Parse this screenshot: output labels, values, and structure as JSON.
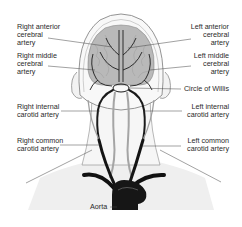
{
  "diagram": {
    "colors": {
      "background": "#ffffff",
      "brain_fill": "#b8b8b8",
      "artery_dark": "#1a1a1a",
      "artery_light": "#9a9a9a",
      "outline": "#7a7a7a",
      "shading": "#ededed",
      "label_text": "#2a2a2a"
    },
    "labels": {
      "right_anterior_cerebral": "Right anterior\ncerebral\nartery",
      "right_middle_cerebral": "Right middle\ncerebral\nartery",
      "right_internal_carotid": "Right internal\ncarotid artery",
      "right_common_carotid": "Right common\ncarotid artery",
      "left_anterior_cerebral": "Left anterior\ncerebral\nartery",
      "left_middle_cerebral": "Left middle\ncerebral\nartery",
      "circle_of_willis": "Circle of Willis",
      "left_internal_carotid": "Left  internal\ncarotid artery",
      "left_common_carotid": "Left  common\ncarotid artery",
      "aorta": "Aorta"
    }
  }
}
